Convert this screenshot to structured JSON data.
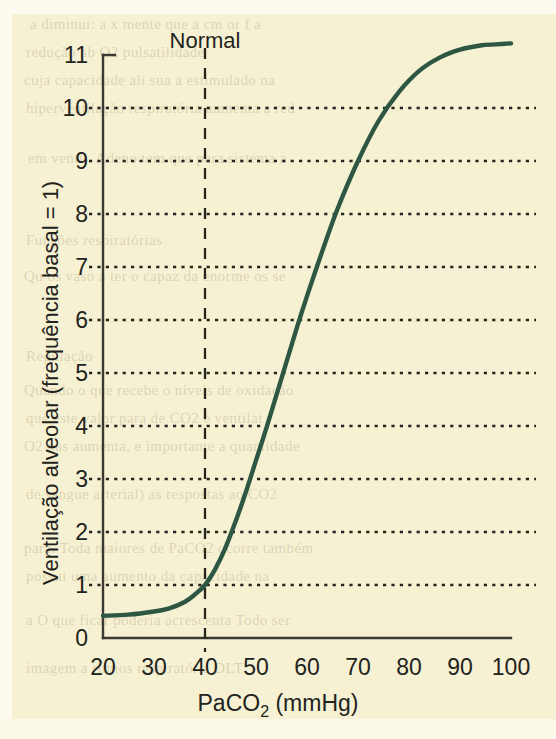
{
  "figure": {
    "background_color": "#f6f1d2",
    "curve_color": "#2d5643",
    "axis_color": "#3a3a32",
    "text_color": "#23231d"
  },
  "annotations": {
    "normal_label": "Normal",
    "normal_x_value": 40
  },
  "ghost_text": [
    {
      "text": "a diminui: a x mente que a cm or f a",
      "x": 30,
      "y": 16
    },
    {
      "text": "redução ab O2 pulsatilidade",
      "x": 26,
      "y": 44
    },
    {
      "text": "cuja capacidade ali sua a estimulado na",
      "x": 24,
      "y": 72
    },
    {
      "text": "hiperventilação respiratória aumenta a red",
      "x": 26,
      "y": 100
    },
    {
      "text": "em ventil. Adeno tem que para sistema a",
      "x": 28,
      "y": 150
    },
    {
      "text": "Funções respiratórias",
      "x": 26,
      "y": 232
    },
    {
      "text": "Qu os vaso a ter o capaz da enorme os se",
      "x": 24,
      "y": 268
    },
    {
      "text": "Regulação",
      "x": 26,
      "y": 348
    },
    {
      "text": "Quando o que recebe o níveis de oxidação",
      "x": 24,
      "y": 382
    },
    {
      "text": "que este valor para de CO2 é ventilat",
      "x": 26,
      "y": 410
    },
    {
      "text": "O2 nas aumenta, e importante a quantidade",
      "x": 24,
      "y": 438
    },
    {
      "text": "de sangue arterial) as respostas ao CO2",
      "x": 26,
      "y": 486
    },
    {
      "text": "para. Toda maiores de PaCO2 ocorre também",
      "x": 24,
      "y": 540
    },
    {
      "text": "possui uma aumento da capacidade na",
      "x": 26,
      "y": 568
    },
    {
      "text": "a O que ficar poderia acrescenta Todo ser",
      "x": 26,
      "y": 612
    },
    {
      "text": "imagem a ritmos respiratória DLT",
      "x": 26,
      "y": 660
    }
  ],
  "chart_data": {
    "type": "line",
    "title": "",
    "xlabel": "PaCO₂ (mmHg)",
    "ylabel": "Ventilação alveolar (frequência basal = 1)",
    "xlim": [
      20,
      100
    ],
    "ylim": [
      0,
      11
    ],
    "grid": true,
    "grid_axis": "y",
    "legend": false,
    "xticks": [
      20,
      30,
      40,
      50,
      60,
      70,
      80,
      90,
      100
    ],
    "yticks": [
      0,
      1,
      2,
      3,
      4,
      5,
      6,
      7,
      8,
      9,
      10,
      11
    ],
    "gridline_values": [
      1,
      2,
      3,
      4,
      5,
      6,
      7,
      8,
      9,
      10
    ],
    "x_axis_title_text": "PaCO",
    "x_axis_title_sub": "2",
    "x_axis_title_unit": " (mmHg)",
    "series": [
      {
        "name": "Ventilação alveolar",
        "x": [
          20,
          25,
          30,
          33,
          36,
          38,
          40,
          42,
          44,
          46,
          48,
          50,
          52,
          55,
          58,
          60,
          63,
          66,
          70,
          74,
          78,
          82,
          86,
          90,
          94,
          97,
          100
        ],
        "y": [
          0.42,
          0.44,
          0.5,
          0.56,
          0.68,
          0.82,
          1.0,
          1.3,
          1.7,
          2.2,
          2.75,
          3.35,
          3.95,
          4.9,
          5.85,
          6.45,
          7.3,
          8.1,
          9.0,
          9.75,
          10.3,
          10.7,
          10.95,
          11.1,
          11.18,
          11.2,
          11.22
        ]
      }
    ]
  }
}
